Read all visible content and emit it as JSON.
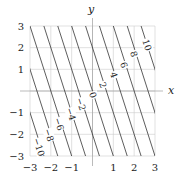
{
  "chart_data": {
    "type": "contour",
    "function": "f(x,y) = 3x + y",
    "levels": [
      -10,
      -8,
      -6,
      -4,
      -2,
      0,
      2,
      4,
      6,
      8,
      10
    ],
    "xlabel": "x",
    "ylabel": "y",
    "xlim": [
      -3,
      3
    ],
    "ylim": [
      -3,
      3
    ],
    "xticks": [
      -3,
      -2,
      -1,
      1,
      2,
      3
    ],
    "yticks": [
      -3,
      -2,
      -1,
      1,
      2,
      3
    ],
    "xtick_labels": [
      "−3",
      "−2",
      "−1",
      "1",
      "2",
      "3"
    ],
    "ytick_labels": [
      "−3",
      "−2",
      "−1",
      "1",
      "2",
      "3"
    ],
    "grid": true,
    "contour_labels": [
      {
        "text": "−10",
        "level": -10,
        "px": 39,
        "py": 147
      },
      {
        "text": "−8",
        "level": -8,
        "px": 49,
        "py": 135
      },
      {
        "text": "−6",
        "level": -6,
        "px": 59,
        "py": 124
      },
      {
        "text": "−4",
        "level": -4,
        "px": 71,
        "py": 114
      },
      {
        "text": "−2",
        "level": -2,
        "px": 81,
        "py": 104
      },
      {
        "text": "0",
        "level": 0,
        "px": 93,
        "py": 95
      },
      {
        "text": "2",
        "level": 2,
        "px": 103,
        "py": 85
      },
      {
        "text": "4",
        "level": 4,
        "px": 114,
        "py": 75
      },
      {
        "text": "6",
        "level": 6,
        "px": 124,
        "py": 65
      },
      {
        "text": "8",
        "level": 8,
        "px": 134,
        "py": 54
      },
      {
        "text": "10",
        "level": 10,
        "px": 147,
        "py": 45
      }
    ],
    "colors": {
      "contour": "#333333",
      "grid": "#cccccc",
      "axis": "#aaaaaa",
      "text": "#222222"
    }
  }
}
